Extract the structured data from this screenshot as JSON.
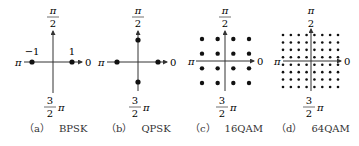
{
  "figure": {
    "panels": [
      {
        "id": "a",
        "caption_label": "（a）",
        "caption_title": "BPSK",
        "axis_labels": {
          "top": [
            "π",
            "2"
          ],
          "bottom": [
            "3",
            "2",
            "π"
          ],
          "left": "π",
          "right": "0"
        },
        "point_labels": [
          "−1",
          "1"
        ],
        "points": [
          [
            -1,
            0
          ],
          [
            1,
            0
          ]
        ]
      },
      {
        "id": "b",
        "caption_label": "（b）",
        "caption_title": "QPSK",
        "axis_labels": {
          "top": [
            "π",
            "2"
          ],
          "bottom": [
            "3",
            "2",
            "π"
          ],
          "left": "π",
          "right": "0"
        },
        "points": [
          [
            -1,
            0
          ],
          [
            1,
            0
          ],
          [
            0,
            1
          ],
          [
            0,
            -1
          ]
        ]
      },
      {
        "id": "c",
        "caption_label": "（c）",
        "caption_title": "16QAM",
        "axis_labels": {
          "top": [
            "π",
            "2"
          ],
          "bottom": [
            "3",
            "2",
            "π"
          ],
          "left": "π",
          "right": "0"
        },
        "grid": 4
      },
      {
        "id": "d",
        "caption_label": "（d）",
        "caption_title": "64QAM",
        "axis_labels": {
          "top": [
            "π",
            "2"
          ],
          "bottom": [
            "3",
            "2",
            "π"
          ],
          "left": "π",
          "right": "0"
        },
        "grid": 8
      }
    ],
    "colors": {
      "axis": "#333333",
      "dot": "#111111",
      "text": "#333333"
    }
  }
}
